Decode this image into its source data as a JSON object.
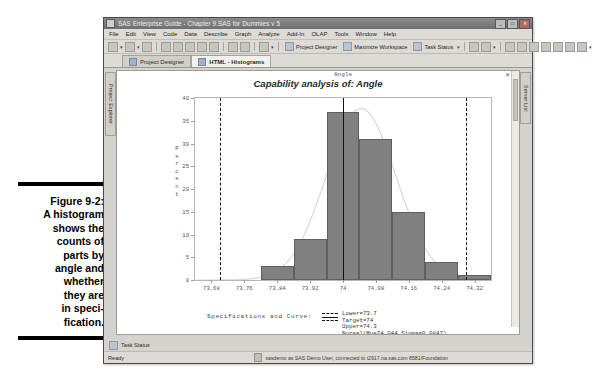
{
  "caption": {
    "label": "Figure 9-2:",
    "lines": [
      "A histogram",
      "shows the",
      "counts of",
      "parts by",
      "angle and",
      "whether",
      "they are",
      "in speci-",
      "fication."
    ]
  },
  "window": {
    "title": "SAS Enterprise Guide - Chapter 9.SAS for Dummies v 5",
    "buttons": {
      "minimize": "_",
      "maximize": "□",
      "close": "✕"
    }
  },
  "menu": {
    "items": [
      "File",
      "Edit",
      "View",
      "Code",
      "Data",
      "Describe",
      "Graph",
      "Analyze",
      "Add-In",
      "OLAP",
      "Tools",
      "Window",
      "Help"
    ]
  },
  "toolbar": {
    "project_designer": "Project Designer",
    "maximize_workspace": "Maximize Workspace",
    "task_status": "Task Status"
  },
  "tabs": [
    {
      "label": "Project Designer",
      "active": false
    },
    {
      "label": "HTML - Histograms",
      "active": true
    }
  ],
  "docks": {
    "left": "Project Explorer",
    "right": "Server List"
  },
  "pane": {
    "close_glyph": "✕"
  },
  "task_strip": {
    "label": "Task Status"
  },
  "status": {
    "left": "Ready",
    "connection": "sasdemo as SAS Demo User, connected to t2917.na.sas.com 8581/Foundation"
  },
  "legend": {
    "title": "Specifications and Curve:",
    "lines": [
      "Lower=73.7",
      "Target=74",
      "Upper=74.3",
      "Normal(Mu=74.044 Sigma=0.0847)"
    ]
  },
  "chart_data": {
    "type": "bar",
    "title": "Capability analysis of: Angle",
    "xlabel": "Angle",
    "ylabel": "Percent",
    "ylim": [
      0,
      40
    ],
    "yticks": [
      0,
      5,
      10,
      15,
      20,
      25,
      30,
      35,
      40
    ],
    "xticks": [
      "73.68",
      "73.76",
      "73.84",
      "73.92",
      "74",
      "74.08",
      "74.16",
      "74.24",
      "74.32"
    ],
    "xlim": [
      73.64,
      74.36
    ],
    "bin_width": 0.08,
    "grid": false,
    "bars": [
      {
        "left": 73.8,
        "right": 73.88,
        "value": 3
      },
      {
        "left": 73.88,
        "right": 73.96,
        "value": 9
      },
      {
        "left": 73.96,
        "right": 74.04,
        "value": 37
      },
      {
        "left": 74.04,
        "right": 74.12,
        "value": 31
      },
      {
        "left": 74.12,
        "right": 74.2,
        "value": 15
      },
      {
        "left": 74.2,
        "right": 74.28,
        "value": 4
      },
      {
        "left": 74.28,
        "right": 74.36,
        "value": 1
      }
    ],
    "reference_lines": [
      {
        "name": "lower-spec",
        "value": 73.7,
        "style": "dashed"
      },
      {
        "name": "target",
        "value": 74.0,
        "style": "solid"
      },
      {
        "name": "upper-spec",
        "value": 74.3,
        "style": "dashed"
      }
    ],
    "normal_curve": {
      "mu": 74.044,
      "sigma": 0.0847,
      "peak_percent": 37.7
    },
    "colors": {
      "bar_fill": "#808080",
      "bar_edge": "#5e5e5e",
      "reference": "#111111",
      "curve": "#d8d8d8"
    }
  }
}
